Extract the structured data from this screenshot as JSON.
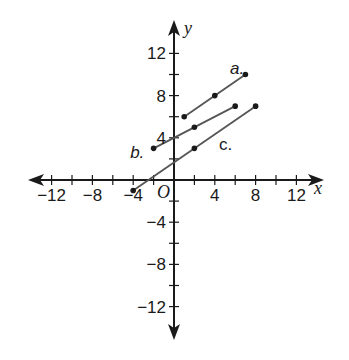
{
  "chart_data": {
    "type": "line",
    "title": "",
    "xlabel": "x",
    "ylabel": "y",
    "origin_label": "O",
    "xlim": [
      -14,
      14
    ],
    "ylim": [
      -14,
      14
    ],
    "grid": false,
    "x_tick_step": 2,
    "y_tick_step": 2,
    "x_tick_labels": [
      {
        "value": -12,
        "label": "−12"
      },
      {
        "value": -8,
        "label": "−8"
      },
      {
        "value": -4,
        "label": "−4"
      },
      {
        "value": 4,
        "label": "4"
      },
      {
        "value": 8,
        "label": "8"
      },
      {
        "value": 12,
        "label": "12"
      }
    ],
    "y_tick_labels": [
      {
        "value": 12,
        "label": "12"
      },
      {
        "value": 8,
        "label": "8"
      },
      {
        "value": 4,
        "label": "4"
      },
      {
        "value": -4,
        "label": "−4"
      },
      {
        "value": -8,
        "label": "−8"
      },
      {
        "value": -12,
        "label": "−12"
      }
    ],
    "series": [
      {
        "name": "a.",
        "points": [
          [
            1,
            6
          ],
          [
            4,
            8
          ],
          [
            7,
            10
          ]
        ],
        "label_pos": [
          5.5,
          10.6
        ]
      },
      {
        "name": "b.",
        "points": [
          [
            -2,
            3
          ],
          [
            2,
            5
          ],
          [
            6,
            7
          ]
        ],
        "label_pos": [
          -4.3,
          2.7
        ]
      },
      {
        "name": "c.",
        "points": [
          [
            -4,
            -1
          ],
          [
            2,
            3
          ],
          [
            8,
            7
          ]
        ],
        "label_pos": [
          4.4,
          3.4
        ]
      }
    ],
    "line_color": "#555555",
    "axis_color": "#1a1a1a"
  }
}
